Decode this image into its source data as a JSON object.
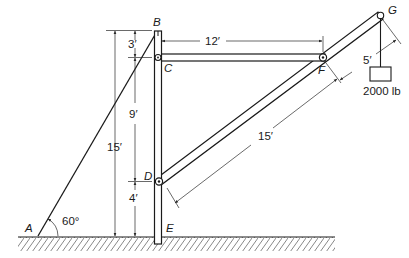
{
  "diagram": {
    "type": "structural-frame",
    "points": {
      "A": "A",
      "B": "B",
      "C": "C",
      "D": "D",
      "E": "E",
      "F": "F",
      "G": "G"
    },
    "dimensions": {
      "BC": "3′",
      "CD": "9′",
      "DE": "4′",
      "BE_total": "15′",
      "CF": "12′",
      "DF": "15′",
      "FG": "5′"
    },
    "angle_A": "60°",
    "load": "2000 lb",
    "colors": {
      "ink": "#1a1a1a",
      "background": "#ffffff"
    }
  }
}
